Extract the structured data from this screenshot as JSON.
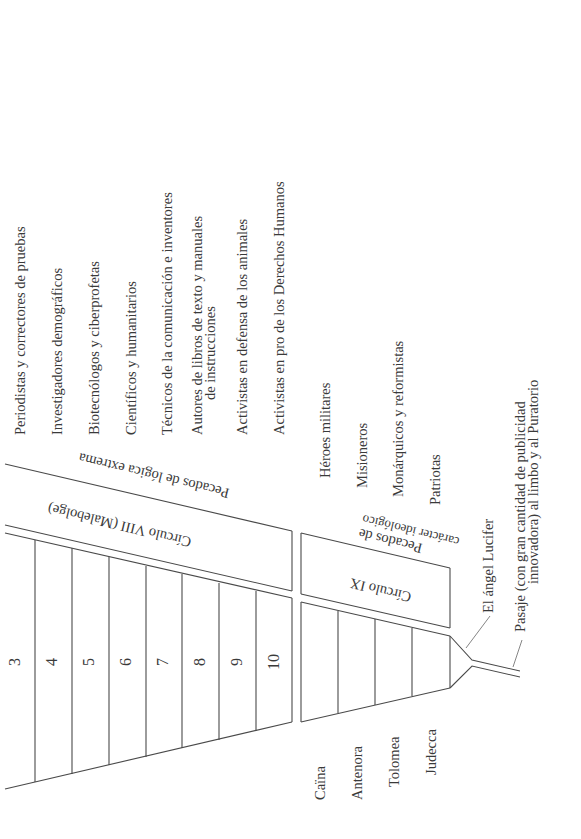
{
  "diagram": {
    "orientation": "rotated 90deg counter-clockwise",
    "circle_viii": {
      "title": "Círculo VIII (Malebolge)",
      "category": "Pecados de lógica extrema",
      "bolgias": [
        {
          "num": "3",
          "label": "Periodistas y correctores de pruebas"
        },
        {
          "num": "4",
          "label": "Investigadores demográficos"
        },
        {
          "num": "5",
          "label": "Biotecnólogos y ciberprofetas"
        },
        {
          "num": "6",
          "label": "Científicos y humanitarios"
        },
        {
          "num": "7",
          "label": "Técnicos de la comunicación e inventores"
        },
        {
          "num": "8",
          "label": "Autores de libros de texto y manuales",
          "label2": "de instrucciones"
        },
        {
          "num": "9",
          "label": "Activistas en defensa de los animales"
        },
        {
          "num": "10",
          "label": "Activistas en pro de los Derechos Humanos"
        }
      ]
    },
    "circle_ix": {
      "title": "Círculo IX",
      "category_line1": "Pecados de",
      "category_line2": "carácter ideológico",
      "zones": [
        {
          "name": "Caïna",
          "label": "Héroes militares"
        },
        {
          "name": "Antenora",
          "label": "Misioneros"
        },
        {
          "name": "Tolomea",
          "label": "Monárquicos y reformistas"
        },
        {
          "name": "Judecca",
          "label": "Patriotas"
        }
      ]
    },
    "lucifer": "El ángel Lucifer",
    "passage_line1": "Pasaje (con gran cantidad de publicidad",
    "passage_line2": "innovadora) al limbo y al Puratorio",
    "colors": {
      "line": "#4a4a4a",
      "text": "#3a3a3a",
      "background": "#ffffff"
    }
  }
}
